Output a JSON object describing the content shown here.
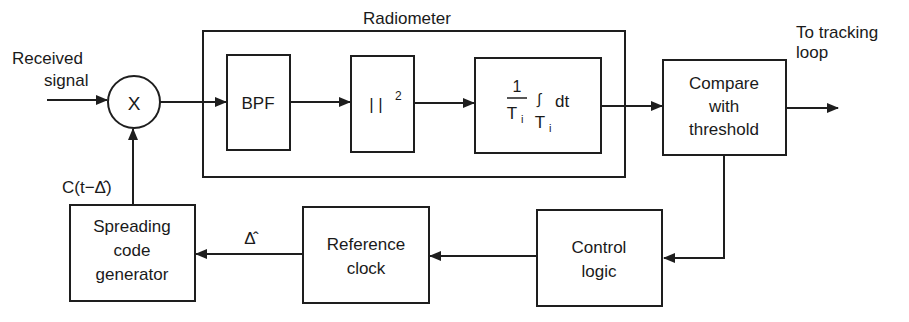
{
  "diagram": {
    "type": "block-diagram",
    "colors": {
      "line": "#1e1e1e",
      "text": "#1a1a1a",
      "background": "#ffffff"
    },
    "input": {
      "line1": "Received",
      "line2": "signal"
    },
    "mixer": {
      "symbol": "X"
    },
    "radiometer": {
      "title": "Radiometer",
      "blocks": {
        "bpf": "BPF",
        "square_law": {
          "bars": "| |",
          "exponent": "2"
        },
        "integrator": {
          "numerator": "1",
          "denominator": "T",
          "denominator_sub": "i",
          "integral": "∫",
          "dt": "dt",
          "limit": "T",
          "limit_sub": "i"
        }
      }
    },
    "compare": {
      "line1": "Compare",
      "line2": "with",
      "line3": "threshold"
    },
    "output": {
      "line1": "To tracking",
      "line2": "loop"
    },
    "control_logic": {
      "line1": "Control",
      "line2": "logic"
    },
    "reference_clock": {
      "line1": "Reference",
      "line2": "clock"
    },
    "spreading_code": {
      "line1": "Spreading",
      "line2": "code",
      "line3": "generator"
    },
    "labels": {
      "delay_estimate": "Δ̂",
      "code_signal_prefix": "C(t−",
      "code_signal_delta": "Δ̂",
      "code_signal_suffix": ")"
    }
  }
}
